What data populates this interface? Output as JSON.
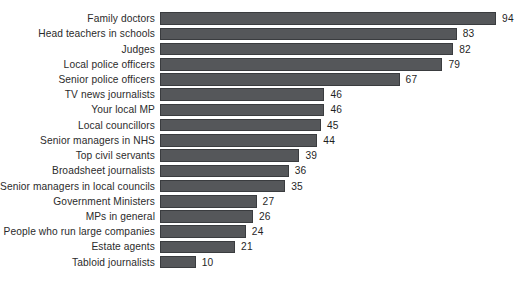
{
  "chart_data": {
    "type": "bar",
    "orientation": "horizontal",
    "title": "",
    "subtitle": "",
    "xlabel": "",
    "ylabel": "",
    "xlim": [
      0,
      94
    ],
    "grid": false,
    "legend": null,
    "bar_color": "#55575a",
    "bar_border_color": "#3a3c3f",
    "background_color": "#ffffff",
    "value_label_color": "#1f1f1f",
    "category_label_color": "#2b2b2b",
    "show_value_labels": true,
    "px_per_unit": 3.575,
    "categories": [
      "Family doctors",
      "Head teachers in schools",
      "Judges",
      "Local police officers",
      "Senior police officers",
      "TV news journalists",
      "Your local MP",
      "Local councillors",
      "Senior managers in NHS",
      "Top civil servants",
      "Broadsheet journalists",
      "Senior managers in local councils",
      "Government Ministers",
      "MPs in general",
      "People who run large companies",
      "Estate agents",
      "Tabloid journalists"
    ],
    "values": [
      94,
      83,
      82,
      79,
      67,
      46,
      46,
      45,
      44,
      39,
      36,
      35,
      27,
      26,
      24,
      21,
      10
    ],
    "value_labels": [
      "94",
      "83",
      "82",
      "79",
      "67",
      "46",
      "46",
      "45",
      "44",
      "39",
      "36",
      "35",
      "27",
      "26",
      "24",
      "21",
      "10"
    ]
  }
}
